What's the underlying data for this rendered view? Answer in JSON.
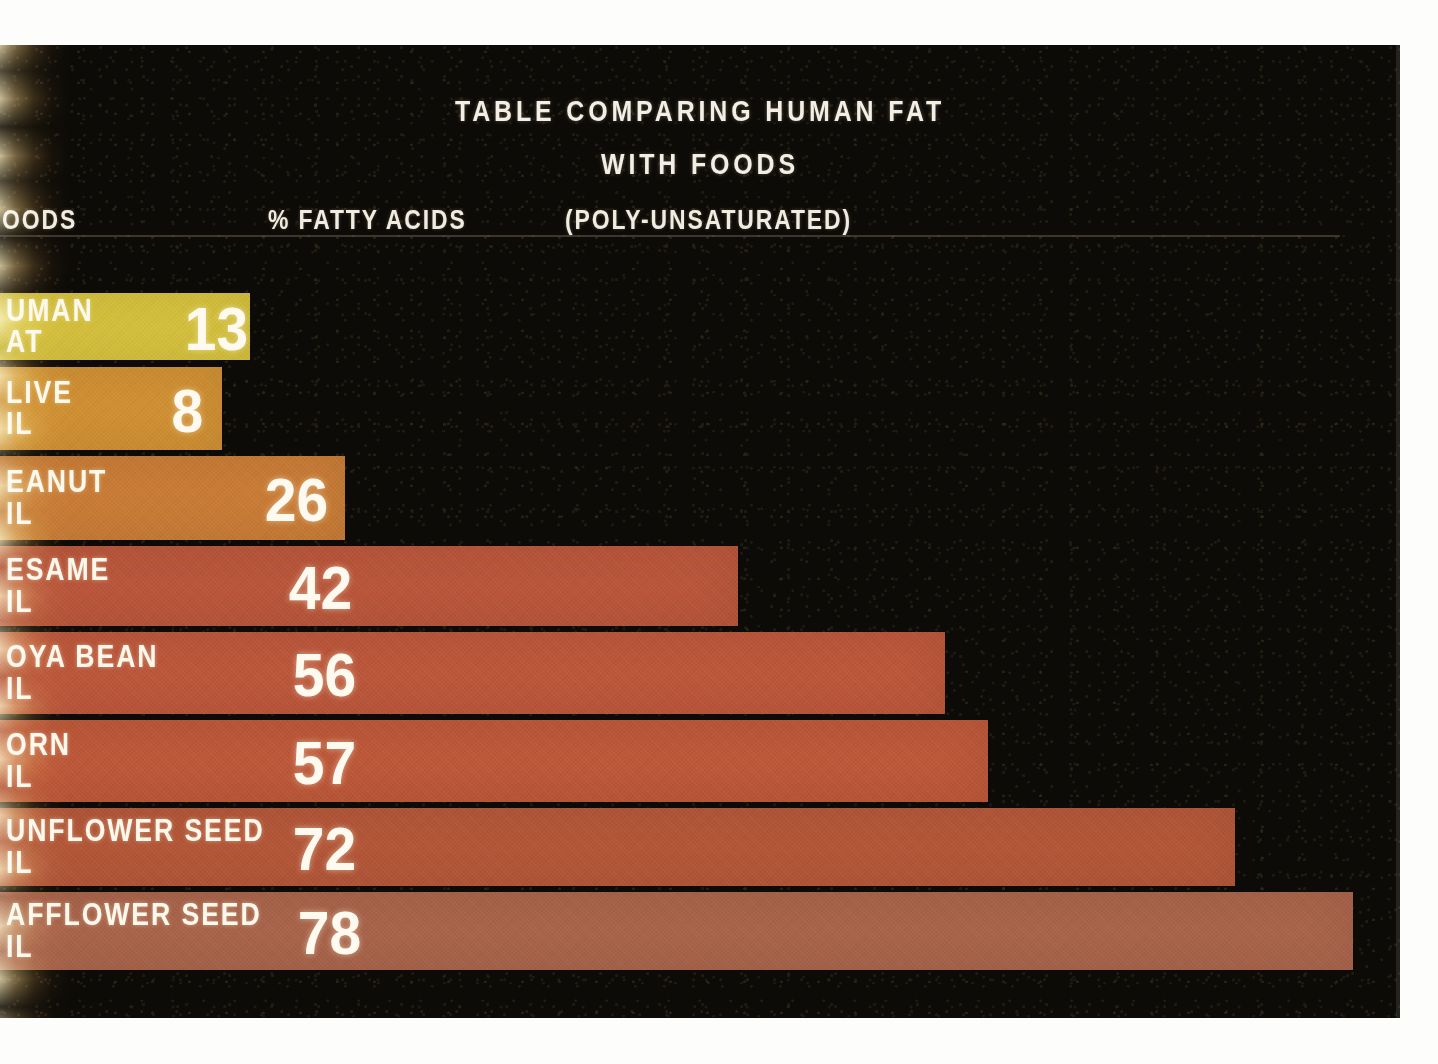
{
  "title": {
    "line1": "TABLE COMPARING HUMAN FAT",
    "line2": "WITH FOODS"
  },
  "header": {
    "foods": "OODS",
    "foods_full": "FOODS",
    "percent_fatty_acids": "% FATTY ACIDS",
    "poly_unsaturated": "(POLY-UNSATURATED)"
  },
  "colors": {
    "background": "#0d0b07",
    "mount": "#fdfdfb",
    "text": "#f3efe6",
    "bar_human_fat": "#d4c03c",
    "bar_olive_oil": "#cf8f32",
    "bar_peanut_oil": "#c87b35",
    "bar_sesame_oil": "#b8553a",
    "bar_soya_bean_oil": "#bb563a",
    "bar_corn_oil": "#bc5738",
    "bar_sunflower_seed_oil": "#b35638",
    "bar_safflower_seed_oil": "#a8634a"
  },
  "chart_data": {
    "type": "bar",
    "title": "TABLE COMPARING HUMAN FAT WITH FOODS",
    "xlabel": "% FATTY ACIDS (POLY-UNSATURATED)",
    "ylabel": "FOODS",
    "orientation": "horizontal",
    "grid": false,
    "legend": null,
    "xlim": [
      0,
      78
    ],
    "categories": [
      "HUMAN FAT",
      "OLIVE OIL",
      "PEANUT OIL",
      "SESAME OIL",
      "SOYA BEAN OIL",
      "CORN OIL",
      "SUNFLOWER SEED OIL",
      "SAFFLOWER SEED OIL"
    ],
    "values": [
      13,
      8,
      26,
      42,
      56,
      57,
      72,
      78
    ],
    "note": "Bar pixel lengths are not strictly proportional to the printed values in the original slide."
  },
  "rows": [
    {
      "label": "UMAN\nAT",
      "label_full": "HUMAN FAT",
      "value": "13",
      "color": "#d4c03c",
      "top": 45,
      "height": 67,
      "width": 250,
      "value_left": 182
    },
    {
      "label": "LIVE\nIL",
      "label_full": "OLIVE OIL",
      "value": "8",
      "color": "#cf8f32",
      "top": 119,
      "height": 83,
      "width": 222,
      "value_left": 170
    },
    {
      "label": "EANUT\nIL",
      "label_full": "PEANUT OIL",
      "value": "26",
      "color": "#c87b35",
      "top": 208,
      "height": 84,
      "width": 345,
      "value_left": 262
    },
    {
      "label": "ESAME\nIL",
      "label_full": "SESAME OIL",
      "value": "42",
      "color": "#b8553a",
      "top": 298,
      "height": 80,
      "width": 738,
      "value_left": 286
    },
    {
      "label": "OYA BEAN\nIL",
      "label_full": "SOYA BEAN OIL",
      "value": "56",
      "color": "#bb563a",
      "top": 384,
      "height": 82,
      "width": 945,
      "value_left": 290
    },
    {
      "label": "ORN\nIL",
      "label_full": "CORN OIL",
      "value": "57",
      "color": "#bc5738",
      "top": 472,
      "height": 82,
      "width": 988,
      "value_left": 290
    },
    {
      "label": "UNFLOWER SEED\nIL",
      "label_full": "SUNFLOWER SEED OIL",
      "value": "72",
      "color": "#b35638",
      "top": 560,
      "height": 78,
      "width": 1235,
      "value_left": 290
    },
    {
      "label": "AFFLOWER SEED\nIL",
      "label_full": "SAFFLOWER SEED OIL",
      "value": "78",
      "color": "#a8634a",
      "top": 644,
      "height": 78,
      "width": 1353,
      "value_left": 295
    }
  ]
}
